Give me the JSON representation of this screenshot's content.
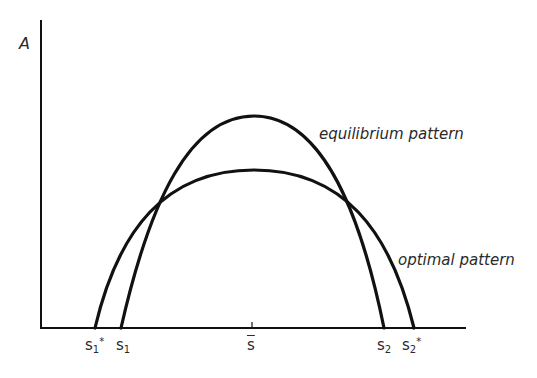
{
  "figure": {
    "y_axis_label": "A",
    "curves": [
      {
        "name": "equilibrium pattern",
        "label": "equilibrium pattern",
        "left_root": "s1",
        "right_root": "s2",
        "peak_height": "higher"
      },
      {
        "name": "optimal pattern",
        "label": "optimal pattern",
        "left_root": "s1*",
        "right_root": "s2*",
        "peak_height": "lower"
      }
    ],
    "x_ticks": {
      "s1_star": {
        "base": "s",
        "sub": "1",
        "sup": "*"
      },
      "s1": {
        "base": "s",
        "sub": "1"
      },
      "s_bar": {
        "base": "s"
      },
      "s2": {
        "base": "s",
        "sub": "2"
      },
      "s2_star": {
        "base": "s",
        "sub": "2",
        "sup": "*"
      }
    },
    "colors": {
      "line": "#111111",
      "text": "#2a2a2a",
      "background": "#ffffff"
    }
  }
}
